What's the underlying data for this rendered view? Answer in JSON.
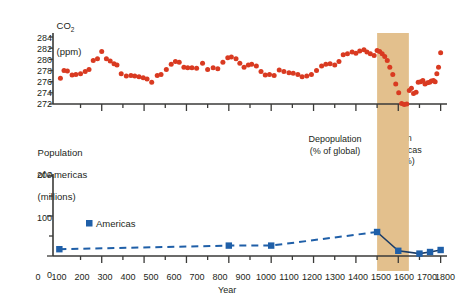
{
  "figure": {
    "background_color": "#ffffff",
    "band_color": "#e3c08d",
    "co2_point_color": "#d93a21",
    "population_color": "#1f5fa8",
    "axis_color": "#3a3a38"
  },
  "co2_panel": {
    "axis_title_line1": "CO",
    "axis_title_sub": "2",
    "axis_title_line2": "(ppm)",
    "y_ticks": [
      "272",
      "274",
      "276",
      "278",
      "280",
      "282",
      "284"
    ]
  },
  "population_panel": {
    "axis_title_line1": "Population",
    "axis_title_line2": "of Americas",
    "axis_title_line3": "(millions)",
    "y_ticks": [
      "0",
      "100",
      "200"
    ],
    "legend_label": "Americas"
  },
  "x_axis": {
    "name": "Year",
    "ticks": [
      "0",
      "100",
      "200",
      "300",
      "400",
      "500",
      "600",
      "700",
      "800",
      "900",
      "1000",
      "1100",
      "1200",
      "1300",
      "1400",
      "1500",
      "1600",
      "1700",
      "1800"
    ]
  },
  "annotations": {
    "depopulation_line1": "Depopulation",
    "depopulation_line2": "(% of global)",
    "band_line1": "50m",
    "band_line2": "Americas",
    "band_line3": "(11%)"
  },
  "chart_data": [
    {
      "type": "scatter",
      "title": "Atmospheric CO2 from ice cores",
      "xlabel": "Year",
      "ylabel": "CO2 (ppm)",
      "xlim": [
        -30,
        1830
      ],
      "ylim": [
        271,
        285
      ],
      "grid": false,
      "legend": "none",
      "series": [
        {
          "name": "CO2 (ppm)",
          "color": "#d93a21",
          "points": [
            [
              5,
              276.6
            ],
            [
              22,
              278.0
            ],
            [
              38,
              277.9
            ],
            [
              60,
              277.2
            ],
            [
              78,
              277.3
            ],
            [
              100,
              277.4
            ],
            [
              122,
              277.8
            ],
            [
              140,
              278.2
            ],
            [
              160,
              279.8
            ],
            [
              180,
              280.1
            ],
            [
              200,
              281.4
            ],
            [
              222,
              280.1
            ],
            [
              240,
              279.7
            ],
            [
              258,
              279.2
            ],
            [
              272,
              279.0
            ],
            [
              292,
              277.4
            ],
            [
              316,
              277.0
            ],
            [
              338,
              277.1
            ],
            [
              356,
              277.0
            ],
            [
              376,
              276.9
            ],
            [
              396,
              276.7
            ],
            [
              414,
              276.5
            ],
            [
              436,
              275.9
            ],
            [
              462,
              277.1
            ],
            [
              480,
              277.3
            ],
            [
              505,
              278.2
            ],
            [
              528,
              279.1
            ],
            [
              548,
              279.6
            ],
            [
              566,
              279.5
            ],
            [
              588,
              278.6
            ],
            [
              606,
              278.5
            ],
            [
              626,
              278.5
            ],
            [
              648,
              278.4
            ],
            [
              676,
              279.3
            ],
            [
              700,
              278.2
            ],
            [
              726,
              278.5
            ],
            [
              748,
              278.3
            ],
            [
              772,
              279.5
            ],
            [
              795,
              280.3
            ],
            [
              812,
              280.4
            ],
            [
              834,
              280.1
            ],
            [
              852,
              279.3
            ],
            [
              872,
              278.6
            ],
            [
              892,
              279.0
            ],
            [
              908,
              279.1
            ],
            [
              930,
              278.8
            ],
            [
              952,
              277.8
            ],
            [
              972,
              277.2
            ],
            [
              992,
              277.3
            ],
            [
              1014,
              277.1
            ],
            [
              1038,
              278.1
            ],
            [
              1060,
              277.8
            ],
            [
              1084,
              277.6
            ],
            [
              1104,
              277.5
            ],
            [
              1126,
              277.3
            ],
            [
              1146,
              276.9
            ],
            [
              1168,
              277.0
            ],
            [
              1190,
              277.3
            ],
            [
              1214,
              278.0
            ],
            [
              1238,
              278.8
            ],
            [
              1258,
              279.1
            ],
            [
              1278,
              279.2
            ],
            [
              1300,
              279.0
            ],
            [
              1320,
              279.6
            ],
            [
              1340,
              280.8
            ],
            [
              1360,
              281.0
            ],
            [
              1382,
              281.3
            ],
            [
              1400,
              281.1
            ],
            [
              1418,
              281.5
            ],
            [
              1438,
              281.7
            ],
            [
              1452,
              281.3
            ],
            [
              1468,
              281.0
            ],
            [
              1486,
              280.7
            ],
            [
              1500,
              281.6
            ],
            [
              1512,
              281.4
            ],
            [
              1524,
              281.0
            ],
            [
              1536,
              280.5
            ],
            [
              1548,
              279.8
            ],
            [
              1560,
              278.6
            ],
            [
              1574,
              277.3
            ],
            [
              1588,
              275.6
            ],
            [
              1602,
              274.0
            ],
            [
              1616,
              272.1
            ],
            [
              1628,
              271.9
            ],
            [
              1640,
              272.0
            ],
            [
              1652,
              274.4
            ],
            [
              1662,
              274.8
            ],
            [
              1672,
              273.9
            ],
            [
              1684,
              274.1
            ],
            [
              1694,
              275.9
            ],
            [
              1706,
              276.0
            ],
            [
              1716,
              276.2
            ],
            [
              1726,
              275.6
            ],
            [
              1738,
              275.8
            ],
            [
              1748,
              275.9
            ],
            [
              1756,
              276.1
            ],
            [
              1766,
              276.2
            ],
            [
              1774,
              276.0
            ],
            [
              1782,
              277.4
            ],
            [
              1790,
              278.6
            ],
            [
              1800,
              281.2
            ]
          ]
        }
      ]
    },
    {
      "type": "line",
      "title": "Population of the Americas",
      "xlabel": "Year",
      "ylabel": "Population of Americas (millions)",
      "xlim": [
        -30,
        1830
      ],
      "ylim": [
        0,
        200
      ],
      "yticks": [
        0,
        50,
        100,
        150,
        200
      ],
      "grid": false,
      "series": [
        {
          "name": "Americas",
          "color": "#1f5fa8",
          "x": [
            0,
            800,
            1000,
            1500,
            1600,
            1700,
            1750,
            1800
          ],
          "y": [
            17,
            26,
            26,
            60,
            13,
            6,
            10,
            15
          ]
        }
      ],
      "shaded_region": {
        "x_start": 1500,
        "x_end": 1650,
        "color": "#e3c08d",
        "label": "50m Americas (11%)"
      }
    }
  ]
}
